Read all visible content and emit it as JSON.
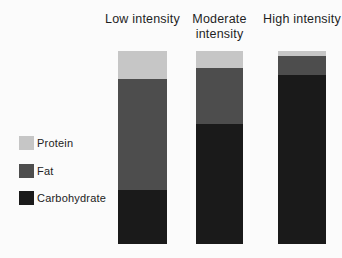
{
  "figure": {
    "background_color": "#fbfbfb",
    "text_color": "#1f1f1f"
  },
  "chart_data": {
    "type": "bar",
    "stacked": true,
    "orientation": "vertical",
    "title": "",
    "xlabel": "",
    "ylabel": "",
    "axes_shown": false,
    "grid": false,
    "legend_position": "left-middle",
    "categories": [
      "Low intensity",
      "Moderate intensity",
      "High intensity"
    ],
    "series": [
      {
        "name": "Protein",
        "color": "#c6c6c6",
        "values": [
          14.5,
          9.0,
          2.5
        ]
      },
      {
        "name": "Fat",
        "color": "#4d4d4d",
        "values": [
          57.5,
          29.0,
          10.0
        ]
      },
      {
        "name": "Carbohydrate",
        "color": "#1a1a1a",
        "values": [
          28.0,
          62.0,
          87.5
        ]
      }
    ],
    "values_unit": "estimated percent of bar height (no numeric axis shown)",
    "ylim": [
      0,
      100
    ]
  }
}
